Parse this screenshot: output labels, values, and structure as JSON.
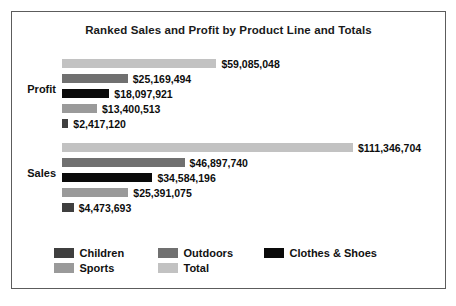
{
  "chart_data": {
    "type": "bar",
    "title": "Ranked Sales and Profit by Product Line and Totals",
    "xlabel": "",
    "ylabel": "",
    "orientation": "horizontal",
    "grid": false,
    "legend_position": "bottom",
    "axis_max": 120000000,
    "categories": [
      "Profit",
      "Sales"
    ],
    "series": [
      {
        "name": "Total",
        "values": [
          59085048,
          111346704
        ]
      },
      {
        "name": "Outdoors",
        "values": [
          25169494,
          46897740
        ]
      },
      {
        "name": "Clothes & Shoes",
        "values": [
          18097921,
          34584196
        ]
      },
      {
        "name": "Sports",
        "values": [
          13400513,
          25391075
        ]
      },
      {
        "name": "Children",
        "values": [
          2417120,
          4473693
        ]
      }
    ],
    "groups": [
      {
        "label": "Profit",
        "bars": [
          {
            "series": "Total",
            "value": 59085048,
            "value_label": "$59,085,048",
            "color": "#c2c2c2"
          },
          {
            "series": "Outdoors",
            "value": 25169494,
            "value_label": "$25,169,494",
            "color": "#707070"
          },
          {
            "series": "Clothes & Shoes",
            "value": 18097921,
            "value_label": "$18,097,921",
            "color": "#0a0a0a"
          },
          {
            "series": "Sports",
            "value": 13400513,
            "value_label": "$13,400,513",
            "color": "#9a9a9a"
          },
          {
            "series": "Children",
            "value": 2417120,
            "value_label": "$2,417,120",
            "color": "#3f3f3f"
          }
        ]
      },
      {
        "label": "Sales",
        "bars": [
          {
            "series": "Total",
            "value": 111346704,
            "value_label": "$111,346,704",
            "color": "#c2c2c2"
          },
          {
            "series": "Outdoors",
            "value": 46897740,
            "value_label": "$46,897,740",
            "color": "#707070"
          },
          {
            "series": "Clothes & Shoes",
            "value": 34584196,
            "value_label": "$34,584,196",
            "color": "#0a0a0a"
          },
          {
            "series": "Sports",
            "value": 25391075,
            "value_label": "$25,391,075",
            "color": "#9a9a9a"
          },
          {
            "series": "Children",
            "value": 4473693,
            "value_label": "$4,473,693",
            "color": "#3f3f3f"
          }
        ]
      }
    ],
    "legend": [
      [
        {
          "label": "Children",
          "color": "#3f3f3f"
        },
        {
          "label": "Outdoors",
          "color": "#707070"
        },
        {
          "label": "Clothes & Shoes",
          "color": "#0a0a0a"
        }
      ],
      [
        {
          "label": "Sports",
          "color": "#9a9a9a"
        },
        {
          "label": "Total",
          "color": "#c2c2c2"
        }
      ]
    ]
  }
}
